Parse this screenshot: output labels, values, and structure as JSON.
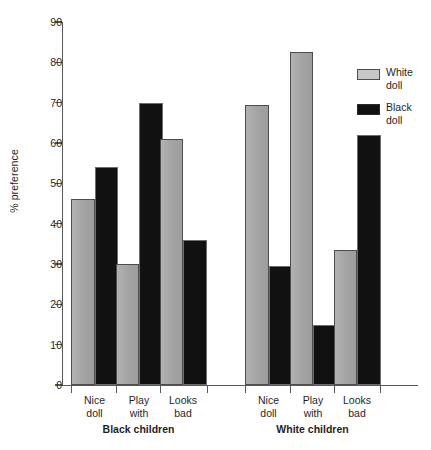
{
  "chart_data": {
    "type": "bar",
    "title": "",
    "xlabel": "",
    "ylabel": "% preference",
    "ylim": [
      0,
      90
    ],
    "ytick_values": [
      0,
      10,
      20,
      30,
      40,
      50,
      60,
      70,
      80,
      90
    ],
    "ytick_labels": [
      "0",
      "10",
      "20",
      "30",
      "40",
      "50",
      "60",
      "70",
      "80",
      "90"
    ],
    "grid": false,
    "legend_position": "right",
    "categories": [
      "Nice doll",
      "Play with",
      "Looks bad",
      "Nice doll",
      "Play with",
      "Looks bad"
    ],
    "category_lines": [
      [
        "Nice",
        "doll"
      ],
      [
        "Play",
        "with"
      ],
      [
        "Looks",
        "bad"
      ],
      [
        "Nice",
        "doll"
      ],
      [
        "Play",
        "with"
      ],
      [
        "Looks",
        "bad"
      ]
    ],
    "groups": [
      {
        "label": "Black children",
        "categories": [
          "Nice doll",
          "Play with",
          "Looks bad"
        ]
      },
      {
        "label": "White children",
        "categories": [
          "Nice doll",
          "Play with",
          "Looks bad"
        ]
      }
    ],
    "series": [
      {
        "name": "White doll",
        "name_lines": [
          "White",
          "doll"
        ],
        "color": "#a8a8a8",
        "values": [
          46,
          30,
          61,
          69.5,
          82.5,
          33.5
        ]
      },
      {
        "name": "Black doll",
        "name_lines": [
          "Black",
          "doll"
        ],
        "color": "#111111",
        "values": [
          54,
          70,
          36,
          29.5,
          15,
          62
        ]
      }
    ]
  },
  "legend": {
    "items": [
      {
        "label_line1": "White",
        "label_line2": "doll",
        "swatch": "white-doll"
      },
      {
        "label_line1": "Black",
        "label_line2": "doll",
        "swatch": "black-doll"
      }
    ]
  },
  "axes": {
    "y_label": "% preference"
  }
}
